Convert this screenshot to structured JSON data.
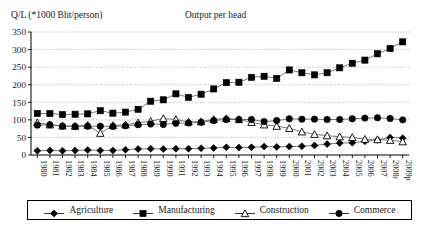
{
  "axis_caption": "Q/L (*1000 Bht/person)",
  "legend": {
    "items": [
      {
        "label": "Agriculture",
        "marker": "diamond-filled-icon"
      },
      {
        "label": "Manufacturing",
        "marker": "square-filled-icon"
      },
      {
        "label": "Construction",
        "marker": "triangle-open-icon"
      },
      {
        "label": "Commerce",
        "marker": "circle-filled-icon"
      }
    ]
  },
  "chart_data": {
    "type": "line",
    "title": "Output per head",
    "xlabel": "",
    "ylabel": "Q/L (*1000 Bht/person)",
    "ylim": [
      0,
      350
    ],
    "yticks": [
      0,
      50,
      100,
      150,
      200,
      250,
      300,
      350
    ],
    "grid": true,
    "legend_position": "bottom",
    "categories": [
      "1980",
      "1981",
      "1982",
      "1983",
      "1984",
      "1985",
      "1986",
      "1987",
      "1988",
      "1989",
      "1990",
      "1991",
      "1992",
      "1993",
      "1994",
      "1995",
      "1996",
      "1997",
      "1998",
      "1999",
      "2000",
      "2001",
      "2002",
      "2003",
      "2004",
      "2005",
      "2006",
      "2007",
      "2008r",
      "2009p"
    ],
    "series": [
      {
        "name": "Agriculture",
        "marker": "diamond-filled-icon",
        "values": [
          12,
          13,
          12,
          13,
          14,
          13,
          13,
          15,
          17,
          18,
          17,
          18,
          18,
          19,
          20,
          22,
          21,
          22,
          24,
          23,
          24,
          25,
          27,
          31,
          34,
          35,
          39,
          43,
          50,
          48
        ]
      },
      {
        "name": "Manufacturing",
        "marker": "square-filled-icon",
        "values": [
          118,
          118,
          115,
          116,
          117,
          126,
          119,
          122,
          130,
          153,
          157,
          174,
          164,
          173,
          188,
          206,
          207,
          221,
          224,
          218,
          242,
          234,
          228,
          234,
          248,
          261,
          270,
          288,
          303,
          322
        ]
      },
      {
        "name": "Construction",
        "marker": "triangle-open-icon",
        "values": [
          92,
          86,
          83,
          82,
          85,
          62,
          84,
          86,
          92,
          96,
          104,
          101,
          94,
          95,
          101,
          104,
          101,
          93,
          86,
          82,
          76,
          66,
          59,
          55,
          52,
          50,
          45,
          44,
          42,
          38
        ]
      },
      {
        "name": "Commerce",
        "marker": "circle-filled-icon",
        "values": [
          85,
          86,
          82,
          81,
          82,
          82,
          81,
          83,
          86,
          88,
          87,
          90,
          91,
          93,
          98,
          101,
          101,
          101,
          95,
          98,
          103,
          102,
          102,
          101,
          101,
          103,
          105,
          106,
          104,
          100
        ]
      }
    ]
  }
}
